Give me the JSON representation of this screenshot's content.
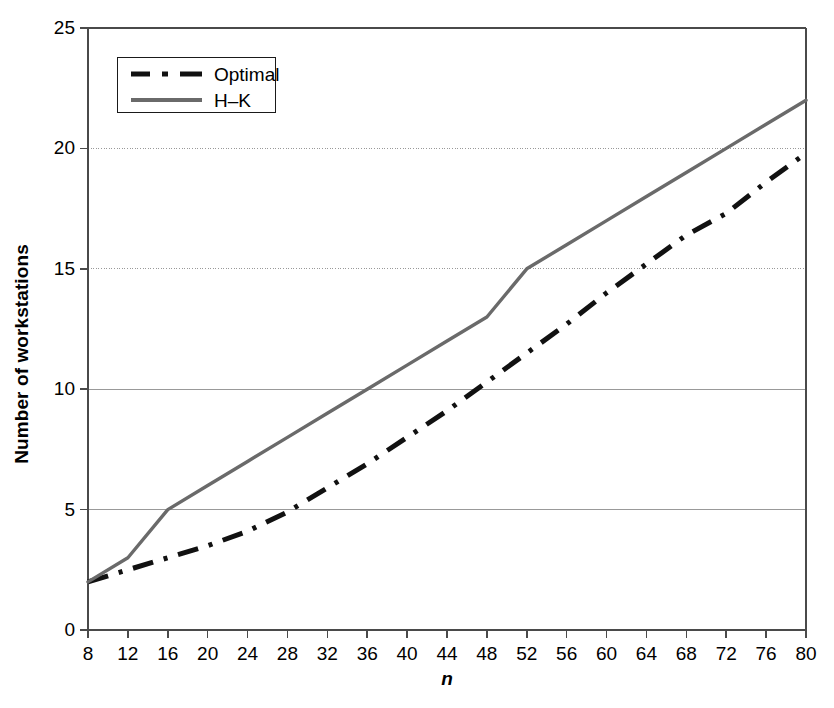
{
  "chart_data": {
    "type": "line",
    "title": "",
    "xlabel": "n",
    "ylabel": "Number of workstations",
    "xlim": [
      8,
      80
    ],
    "ylim": [
      0,
      25
    ],
    "xticks": [
      8,
      12,
      16,
      20,
      24,
      28,
      32,
      36,
      40,
      44,
      48,
      52,
      56,
      60,
      64,
      68,
      72,
      76,
      80
    ],
    "yticks": [
      0,
      5,
      10,
      15,
      20,
      25
    ],
    "grid": "horizontal",
    "legend_position": "top-left",
    "series": [
      {
        "name": "Optimal",
        "style": "dash-dot",
        "color": "#111111",
        "x": [
          8,
          12,
          16,
          20,
          24,
          28,
          32,
          36,
          40,
          44,
          48,
          52,
          56,
          60,
          64,
          68,
          72,
          76,
          80
        ],
        "values": [
          2.0,
          2.5,
          3.0,
          3.5,
          4.1,
          4.9,
          5.9,
          6.9,
          8.0,
          9.1,
          10.3,
          11.5,
          12.7,
          14.0,
          15.2,
          16.4,
          17.3,
          18.6,
          19.8
        ]
      },
      {
        "name": "H–K",
        "style": "solid",
        "color": "#6a6a6a",
        "x": [
          8,
          12,
          16,
          20,
          24,
          28,
          32,
          36,
          40,
          44,
          48,
          52,
          56,
          60,
          64,
          68,
          72,
          76,
          80
        ],
        "values": [
          2.0,
          3.0,
          5.0,
          6.0,
          7.0,
          8.0,
          9.0,
          10.0,
          11.0,
          12.0,
          13.0,
          15.0,
          16.0,
          17.0,
          18.0,
          19.0,
          20.0,
          21.0,
          22.0
        ]
      }
    ]
  },
  "legend": {
    "entries": [
      {
        "label": "Optimal"
      },
      {
        "label": "H–K"
      }
    ]
  },
  "axes": {
    "y_title": "Number of workstations",
    "x_title": "n",
    "y_tick_labels": [
      "0",
      "5",
      "10",
      "15",
      "20",
      "25"
    ],
    "x_tick_labels": [
      "8",
      "12",
      "16",
      "20",
      "24",
      "28",
      "32",
      "36",
      "40",
      "44",
      "48",
      "52",
      "56",
      "60",
      "64",
      "68",
      "72",
      "76",
      "80"
    ]
  },
  "colors": {
    "axis": "#4a4a4a",
    "grid": "#999999",
    "optimal_line": "#111111",
    "hk_line": "#6a6a6a",
    "background": "#ffffff"
  }
}
